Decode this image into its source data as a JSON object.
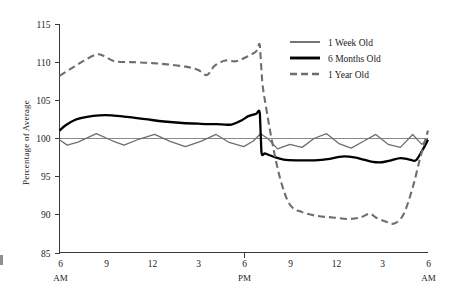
{
  "chart_data": {
    "type": "line",
    "title": "",
    "xlabel": "",
    "ylabel": "Percentage of Average",
    "ylim": [
      85,
      115
    ],
    "yticks": [
      85,
      90,
      95,
      100,
      105,
      110,
      115
    ],
    "ytick_labels": [
      "85",
      "90",
      "95",
      "100",
      "105",
      "110",
      "115"
    ],
    "xlim": [
      6,
      30
    ],
    "xticks": [
      6,
      9,
      12,
      15,
      18,
      21,
      24,
      27,
      30
    ],
    "xtick_labels": [
      "6",
      "9",
      "12",
      "3",
      "6",
      "9",
      "12",
      "3",
      "6"
    ],
    "xtick_sublabels": [
      "AM",
      "",
      "",
      "",
      "PM",
      "",
      "",
      "",
      "AM"
    ],
    "grid": false,
    "reference_line_y": 100,
    "legend_position": "top-right",
    "series": [
      {
        "name": "1 Week Old",
        "color": "#6e6e6e",
        "style": "solid",
        "width": 1.3,
        "x": [
          6,
          6.5,
          7.2,
          8.4,
          9.4,
          10.2,
          11.2,
          12.2,
          13.2,
          14.2,
          15.2,
          16.2,
          17.0,
          18.0,
          18.6,
          19.1,
          19.6,
          20.2,
          21.0,
          21.8,
          22.6,
          23.4,
          24.2,
          25.0,
          25.8,
          26.6,
          27.4,
          28.2,
          29.0,
          29.6,
          30.0
        ],
        "y": [
          99.8,
          99.1,
          99.5,
          100.6,
          99.7,
          99.1,
          99.9,
          100.5,
          99.6,
          98.9,
          99.6,
          100.5,
          99.5,
          98.9,
          99.6,
          100.6,
          99.9,
          98.6,
          99.2,
          98.8,
          100.0,
          100.6,
          99.3,
          98.7,
          99.6,
          100.5,
          99.2,
          98.8,
          100.5,
          99.2,
          100.0
        ]
      },
      {
        "name": "6 Months Old",
        "color": "#000000",
        "style": "solid",
        "width": 2.3,
        "x": [
          6,
          6.4,
          7.0,
          7.8,
          8.6,
          9.4,
          10.4,
          11.6,
          12.8,
          14.0,
          15.2,
          16.2,
          17.2,
          17.9,
          18.3,
          18.8,
          19.05,
          19.15,
          19.4,
          19.9,
          20.6,
          21.6,
          22.6,
          23.6,
          24.4,
          25.2,
          25.8,
          26.4,
          27.0,
          27.6,
          28.2,
          28.8,
          29.2,
          29.6,
          30.0
        ],
        "y": [
          101.0,
          101.7,
          102.4,
          102.8,
          103.0,
          103.0,
          102.8,
          102.5,
          102.2,
          102.0,
          101.9,
          101.85,
          101.8,
          102.4,
          102.9,
          103.2,
          103.25,
          98.2,
          98.0,
          97.6,
          97.2,
          97.1,
          97.1,
          97.3,
          97.6,
          97.5,
          97.2,
          96.9,
          96.85,
          97.1,
          97.4,
          97.2,
          97.1,
          98.3,
          99.8
        ]
      },
      {
        "name": "1 Year Old",
        "color": "#6e6e6e",
        "style": "dashed",
        "width": 2.1,
        "x": [
          6,
          6.8,
          7.6,
          8.4,
          8.9,
          9.6,
          10.6,
          11.8,
          13.0,
          14.2,
          15.0,
          15.6,
          16.1,
          16.8,
          17.5,
          18.2,
          18.8,
          19.05,
          19.2,
          19.5,
          19.9,
          20.4,
          21.0,
          21.8,
          22.8,
          23.8,
          24.8,
          25.6,
          26.2,
          26.6,
          27.2,
          27.8,
          28.4,
          29.0,
          29.5,
          30.0
        ],
        "y": [
          108.2,
          109.2,
          110.2,
          111.0,
          110.8,
          110.1,
          110.0,
          109.9,
          109.7,
          109.4,
          109.0,
          108.3,
          109.5,
          110.2,
          110.1,
          110.7,
          111.4,
          112.2,
          107.5,
          103.5,
          99.0,
          94.5,
          91.3,
          90.3,
          89.8,
          89.6,
          89.4,
          89.6,
          90.1,
          89.6,
          89.1,
          88.8,
          90.0,
          93.5,
          97.5,
          101.0
        ]
      }
    ]
  },
  "legend": {
    "items": [
      {
        "label": "1 Week Old"
      },
      {
        "label": "6 Months Old"
      },
      {
        "label": "1 Year Old"
      }
    ]
  }
}
